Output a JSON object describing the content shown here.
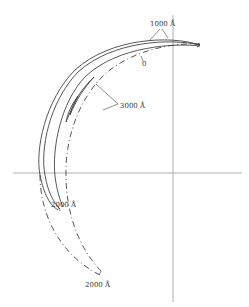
{
  "diagram": {
    "type": "polar-locus",
    "axes": {
      "horizontal": {
        "y": 173,
        "x_start": 13,
        "x_end": 242
      },
      "vertical": {
        "x": 173,
        "y_start": 15,
        "y_end": 302
      }
    },
    "labels": {
      "top": "1000 Å",
      "origin_dash": "0",
      "middle": "3000 Å",
      "lower_solid": "2000 Å",
      "lower_dash": "2000 Å"
    },
    "colors": {
      "line": "#444444",
      "axis": "#888888",
      "background": "#ffffff"
    }
  }
}
